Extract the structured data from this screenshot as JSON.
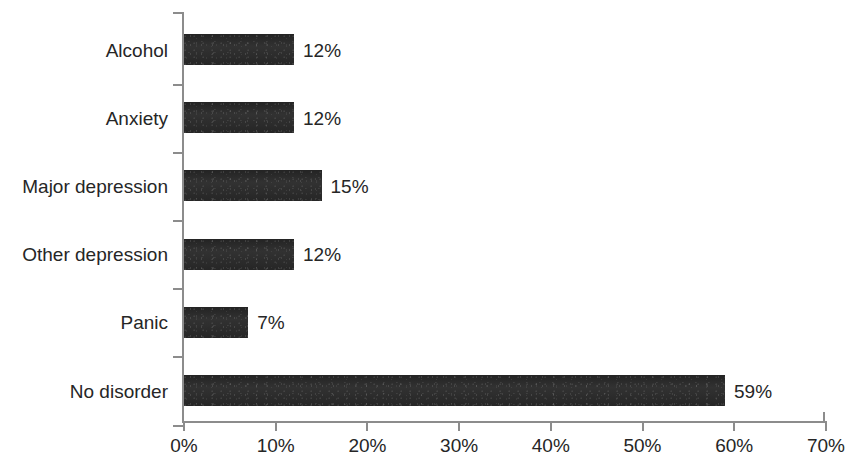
{
  "chart_data": {
    "type": "bar",
    "orientation": "horizontal",
    "title": "",
    "subtitle": "",
    "xlabel": "",
    "ylabel": "",
    "categories": [
      "Alcohol",
      "Anxiety",
      "Major depression",
      "Other depression",
      "Panic",
      "No disorder"
    ],
    "values": [
      12,
      12,
      15,
      12,
      7,
      59
    ],
    "value_labels": [
      "12%",
      "12%",
      "15%",
      "12%",
      "7%",
      "59%"
    ],
    "xlim": [
      0,
      70
    ],
    "x_tick_values": [
      0,
      10,
      20,
      30,
      40,
      50,
      60,
      70
    ],
    "x_tick_labels": [
      "0%",
      "10%",
      "20%",
      "30%",
      "40%",
      "50%",
      "60%",
      "70%"
    ],
    "grid": false,
    "legend": false,
    "legend_position": "none",
    "bar_color": "#2b2b2b",
    "axis_color": "#8c8c8c",
    "text_color": "#262626",
    "background_color": "#ffffff"
  }
}
